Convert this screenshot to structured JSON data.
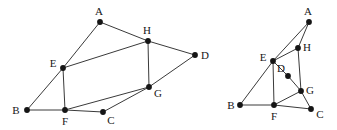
{
  "figure": {
    "title": "",
    "width": 337,
    "height": 130,
    "background": "#ffffff",
    "edge_color": "#3a3a3a",
    "vertex_color": "#151515",
    "label_color": "#171717"
  },
  "graphs": [
    {
      "id": "left-graph",
      "name": "graph-left",
      "vertices": [
        {
          "id": "A",
          "label": "A",
          "x": 100,
          "y": 22,
          "label_x": 99,
          "label_y": 11
        },
        {
          "id": "B",
          "label": "B",
          "x": 27,
          "y": 110,
          "label_x": 16,
          "label_y": 110
        },
        {
          "id": "C",
          "label": "C",
          "x": 103,
          "y": 112,
          "label_x": 111,
          "label_y": 120
        },
        {
          "id": "D",
          "label": "D",
          "x": 195,
          "y": 55,
          "label_x": 205,
          "label_y": 55
        },
        {
          "id": "E",
          "label": "E",
          "x": 63,
          "y": 68,
          "label_x": 53,
          "label_y": 63
        },
        {
          "id": "F",
          "label": "F",
          "x": 65,
          "y": 110,
          "label_x": 65,
          "label_y": 121
        },
        {
          "id": "G",
          "label": "G",
          "x": 149,
          "y": 87,
          "label_x": 158,
          "label_y": 93
        },
        {
          "id": "H",
          "label": "H",
          "x": 148,
          "y": 41,
          "label_x": 147,
          "label_y": 30
        }
      ],
      "edges": [
        {
          "from": "A",
          "to": "E"
        },
        {
          "from": "A",
          "to": "H"
        },
        {
          "from": "E",
          "to": "H"
        },
        {
          "from": "E",
          "to": "B"
        },
        {
          "from": "E",
          "to": "F"
        },
        {
          "from": "B",
          "to": "F"
        },
        {
          "from": "F",
          "to": "C"
        },
        {
          "from": "F",
          "to": "G"
        },
        {
          "from": "C",
          "to": "G"
        },
        {
          "from": "G",
          "to": "H"
        },
        {
          "from": "G",
          "to": "D"
        },
        {
          "from": "H",
          "to": "D"
        }
      ]
    },
    {
      "id": "right-graph",
      "name": "graph-right",
      "vertices": [
        {
          "id": "A",
          "label": "A",
          "x": 309,
          "y": 22,
          "label_x": 308,
          "label_y": 11
        },
        {
          "id": "B",
          "label": "B",
          "x": 240,
          "y": 105,
          "label_x": 231,
          "label_y": 105
        },
        {
          "id": "C",
          "label": "C",
          "x": 311,
          "y": 109,
          "label_x": 320,
          "label_y": 114
        },
        {
          "id": "D",
          "label": "D",
          "x": 288,
          "y": 76,
          "label_x": 281,
          "label_y": 68
        },
        {
          "id": "E",
          "label": "E",
          "x": 273,
          "y": 61,
          "label_x": 263,
          "label_y": 57
        },
        {
          "id": "F",
          "label": "F",
          "x": 274,
          "y": 105,
          "label_x": 274,
          "label_y": 116
        },
        {
          "id": "G",
          "label": "G",
          "x": 301,
          "y": 91,
          "label_x": 310,
          "label_y": 90
        },
        {
          "id": "H",
          "label": "H",
          "x": 298,
          "y": 48,
          "label_x": 307,
          "label_y": 47
        }
      ],
      "edges": [
        {
          "from": "A",
          "to": "E"
        },
        {
          "from": "A",
          "to": "H"
        },
        {
          "from": "E",
          "to": "H"
        },
        {
          "from": "E",
          "to": "D"
        },
        {
          "from": "E",
          "to": "B"
        },
        {
          "from": "E",
          "to": "F"
        },
        {
          "from": "B",
          "to": "F"
        },
        {
          "from": "D",
          "to": "G"
        },
        {
          "from": "F",
          "to": "G"
        },
        {
          "from": "F",
          "to": "C"
        },
        {
          "from": "G",
          "to": "C"
        },
        {
          "from": "G",
          "to": "H"
        }
      ]
    }
  ]
}
